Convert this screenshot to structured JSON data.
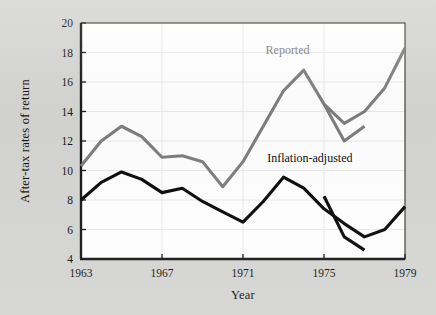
{
  "figure": {
    "background_color": "#d5d5d3",
    "plot_background_color": "#ffffff"
  },
  "axes": {
    "y_title": "After-tax rates of return",
    "x_title": "Year",
    "y_ticks": [
      "4",
      "6",
      "8",
      "10",
      "12",
      "14",
      "16",
      "18",
      "20"
    ],
    "x_ticks": [
      "1963",
      "1967",
      "1971",
      "1975",
      "1979"
    ]
  },
  "labels": {
    "reported": "Reported",
    "inflation_adjusted": "Inflation-adjusted"
  },
  "colors": {
    "reported": "#7e7e7e",
    "inflation_adjusted": "#0b0b0b",
    "axis": "#1a1a1a",
    "grid": "#e9e9e9"
  },
  "chart_data": {
    "type": "line",
    "title": "",
    "xlabel": "Year",
    "ylabel": "After-tax rates of return",
    "xlim": [
      1963,
      1979
    ],
    "ylim": [
      4,
      20
    ],
    "ytick_step": 2,
    "grid": true,
    "legend": "inline-annotations",
    "x": [
      1963,
      1964,
      1965,
      1966,
      1967,
      1968,
      1969,
      1970,
      1971,
      1972,
      1973,
      1974,
      1975,
      1976,
      1977,
      1978,
      1979
    ],
    "series": [
      {
        "name": "Reported",
        "color": "#7e7e7e",
        "x": [
          1963,
          1964,
          1965,
          1966,
          1967,
          1968,
          1969,
          1970,
          1971,
          1972,
          1973,
          1974,
          1975,
          1976,
          1977,
          1978,
          1979
        ],
        "values": [
          10.3,
          12.0,
          13.0,
          12.3,
          10.9,
          11.0,
          10.6,
          8.9,
          10.6,
          13.0,
          15.4,
          16.8,
          14.5,
          13.2,
          14.0,
          15.6,
          18.3
        ]
      },
      {
        "name": "Reported (revised branch)",
        "color": "#7e7e7e",
        "x": [
          1975,
          1976,
          1977
        ],
        "values": [
          14.5,
          12.0,
          13.0
        ]
      },
      {
        "name": "Inflation-adjusted",
        "color": "#0b0b0b",
        "x": [
          1963,
          1964,
          1965,
          1966,
          1967,
          1968,
          1969,
          1970,
          1971,
          1972,
          1973,
          1974,
          1975,
          1976,
          1977,
          1978,
          1979
        ],
        "values": [
          8.0,
          9.2,
          9.9,
          9.4,
          8.5,
          8.8,
          7.9,
          7.2,
          6.5,
          7.9,
          9.55,
          8.8,
          7.4,
          6.4,
          5.5,
          6.0,
          7.55
        ]
      },
      {
        "name": "Inflation-adjusted (revised branch)",
        "color": "#0b0b0b",
        "x": [
          1975,
          1976,
          1977
        ],
        "values": [
          8.25,
          5.5,
          4.6
        ]
      }
    ],
    "annotations": [
      {
        "text": "Reported",
        "x": 1973.2,
        "y": 17.9,
        "color": "#7e7e7e"
      },
      {
        "text": "Inflation-adjusted",
        "x": 1974.3,
        "y": 10.6,
        "color": "#0b0b0b"
      }
    ]
  }
}
